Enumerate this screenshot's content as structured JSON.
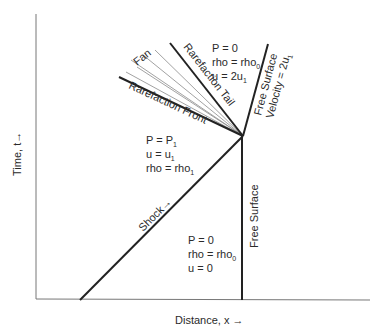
{
  "diagram": {
    "type": "x-t wave diagram",
    "axes": {
      "x_label": "Distance, x →",
      "y_label": "Time, t→"
    },
    "lines": {
      "shock": "Shock→",
      "free_surface": "Free Surface",
      "free_surface_velocity_line1": "Free Surface",
      "free_surface_velocity_line2": "Velocity = 2u",
      "free_surface_velocity_sub": "1",
      "rarefaction_tail": "Rarefaction Tail",
      "rarefaction_front": "Rarefaction Front",
      "fan": "Fan"
    },
    "regions": {
      "top": {
        "p": "P = 0",
        "rho": "rho = rho",
        "rho_sub": "0",
        "u": "u = 2u",
        "u_sub": "1"
      },
      "shocked": {
        "p": "P = P",
        "p_sub": "1",
        "u": "u = u",
        "u_sub": "1",
        "rho": "rho = rho",
        "rho_sub": "1"
      },
      "unshocked": {
        "p": "P = 0",
        "rho": "rho = rho",
        "rho_sub": "0",
        "u": "u = 0"
      }
    },
    "colors": {
      "line": "#222222",
      "fan": "#888888",
      "axis": "#777777"
    }
  }
}
